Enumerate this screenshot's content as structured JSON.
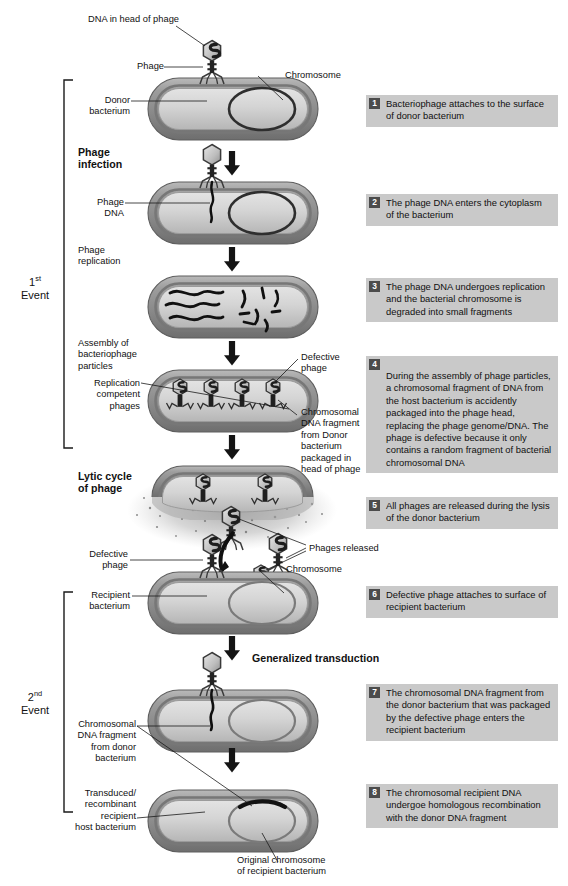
{
  "figure": {
    "title": "Generalized transduction",
    "palette": {
      "cell_outer": "#8d8d8d",
      "cell_inner": "#c3c3c3",
      "cytoplasm": "#d2d2d2",
      "chromosome": "#3a3a3a",
      "phage": "#2b2b2b",
      "callout_bg": "#c9c9c9",
      "badge_bg": "#4c4c4c",
      "badge_fg": "#ffffff",
      "line": "#1a1a1a"
    }
  },
  "events": [
    {
      "ordinal": "1",
      "suffix": "st",
      "word": "Event"
    },
    {
      "ordinal": "2",
      "suffix": "nd",
      "word": "Event"
    }
  ],
  "stage_labels": [
    {
      "id": "phage-infection",
      "text": "Phage\ninfection",
      "bold": true
    },
    {
      "id": "phage-replication",
      "text": "Phage\nreplication",
      "bold": false
    },
    {
      "id": "assembly",
      "text": "Assembly of\nbacteriophage\nparticles",
      "bold": false
    },
    {
      "id": "lytic-cycle",
      "text": "Lytic cycle\nof phage",
      "bold": true
    },
    {
      "id": "generalized-transduction",
      "text": "Generalized transduction",
      "bold": true
    }
  ],
  "part_labels": [
    {
      "id": "dna-in-head",
      "text": "DNA in head of phage"
    },
    {
      "id": "phage",
      "text": "Phage"
    },
    {
      "id": "chromosome-1",
      "text": "Chromosome"
    },
    {
      "id": "donor-bacterium",
      "text": "Donor\nbacterium"
    },
    {
      "id": "phage-dna",
      "text": "Phage\nDNA"
    },
    {
      "id": "defective-phage-1",
      "text": "Defective\nphage"
    },
    {
      "id": "replication-competent",
      "text": "Replication\ncompetent\nphages"
    },
    {
      "id": "chromosomal-fragment-donor",
      "text": "Chromosomal\nDNA fragment\nfrom Donor\nbacterium\npackaged in\nhead of phage"
    },
    {
      "id": "phages-released",
      "text": "Phages released"
    },
    {
      "id": "defective-phage-2",
      "text": "Defective\nphage"
    },
    {
      "id": "chromosome-2",
      "text": "Chromosome"
    },
    {
      "id": "recipient-bacterium",
      "text": "Recipient\nbacterium"
    },
    {
      "id": "chromosomal-fragment-donor-2",
      "text": "Chromosomal\nDNA fragment\nfrom donor\nbacterium"
    },
    {
      "id": "transduced-recombinant",
      "text": "Transduced/\nrecombinant\nrecipient\nhost bacterium"
    },
    {
      "id": "original-chromosome",
      "text": "Original chromosome\nof recipient bacterium"
    }
  ],
  "steps": [
    {
      "num": "1",
      "text": "Bacteriophage attaches to the surface of donor bacterium"
    },
    {
      "num": "2",
      "text": "The phage DNA enters the cytoplasm of the bacterium"
    },
    {
      "num": "3",
      "text": "The phage DNA undergoes replication and the bacterial chromosome is degraded into small fragments"
    },
    {
      "num": "4",
      "text": "During the assembly of phage particles, a chromosomal fragment of DNA from the host bacterium is accidently packaged into the phage head, replacing the phage genome/DNA. The phage is defective because it only contains a random fragment of bacterial chromosomal DNA"
    },
    {
      "num": "5",
      "text": "All phages are released during the lysis of the donor bacterium"
    },
    {
      "num": "6",
      "text": "Defective phage attaches to surface of recipient bacterium"
    },
    {
      "num": "7",
      "text": "The chromosomal DNA fragment from the donor bacterium that was packaged by the defective phage enters the recipient bacterium"
    },
    {
      "num": "8",
      "text": "The chromosomal recipient DNA undergoe homologous recombination with the donor DNA fragment"
    }
  ]
}
